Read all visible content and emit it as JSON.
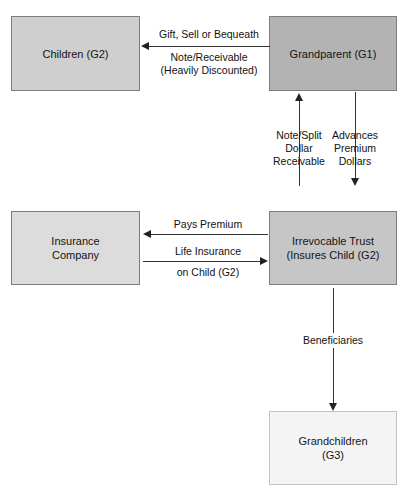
{
  "title": "INTER-GENERATIONAL SPLIT DOLLAR",
  "colors": {
    "children_fill": "#cfcfcf",
    "grandparent_fill": "#b3b3b3",
    "insurance_fill": "#dcdcdc",
    "trust_fill": "#c6c6c6",
    "grandchildren_fill": "#f4f4f4",
    "border": "#7d7d7d",
    "arrow": "#222222",
    "text": "#141414",
    "background": "#ffffff"
  },
  "nodes": {
    "children": {
      "label": "Children (G2)"
    },
    "grandparent": {
      "label": "Grandparent (G1)"
    },
    "insurance": {
      "line1": "Insurance",
      "line2": "Company"
    },
    "trust": {
      "line1": "Irrevocable Trust",
      "line2": "(Insures Child (G2)"
    },
    "grandchildren": {
      "line1": "Grandchildren",
      "line2": "(G3)"
    }
  },
  "edges": {
    "gift": {
      "above": "Gift, Sell or Bequeath",
      "below_line1": "Note/Receivable",
      "below_line2": "(Heavily Discounted)",
      "direction": "left",
      "from": "grandparent",
      "to": "children"
    },
    "note_split": {
      "line1": "Note/Split",
      "line2": "Dollar",
      "line3": "Receivable",
      "direction": "up",
      "from": "trust",
      "to": "grandparent"
    },
    "advances": {
      "line1": "Advances",
      "line2": "Premium",
      "line3": "Dollars",
      "direction": "down",
      "from": "grandparent",
      "to": "trust"
    },
    "pays_premium": {
      "label": "Pays Premium",
      "direction": "left",
      "from": "trust",
      "to": "insurance"
    },
    "life_insurance": {
      "above": "Life Insurance",
      "below": "on Child (G2)",
      "direction": "right",
      "from": "insurance",
      "to": "trust"
    },
    "beneficiaries": {
      "label": "Beneficiaries",
      "direction": "down",
      "from": "trust",
      "to": "grandchildren"
    }
  }
}
